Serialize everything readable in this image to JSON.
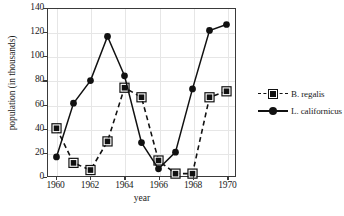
{
  "chart_data": {
    "type": "line",
    "title": "",
    "xlabel": "year",
    "ylabel": "population (in thousands)",
    "xlim": [
      1959.5,
      1970.5
    ],
    "ylim": [
      0,
      140
    ],
    "ytick_labels": [
      "0",
      "20",
      "40",
      "60",
      "80",
      "100",
      "120",
      "140"
    ],
    "ytick_values": [
      0,
      20,
      40,
      60,
      80,
      100,
      120,
      140
    ],
    "xtick_labels": [
      "1960",
      "1962",
      "1964",
      "1966",
      "1968",
      "1970"
    ],
    "xtick_values": [
      1960,
      1962,
      1964,
      1966,
      1968,
      1970
    ],
    "x": [
      1960,
      1961,
      1962,
      1963,
      1964,
      1965,
      1966,
      1967,
      1968,
      1969,
      1970
    ],
    "grid": true,
    "legend_position": "right",
    "series": [
      {
        "name": "B. regalis",
        "marker": "square",
        "linestyle": "dashed",
        "color": "#111111",
        "values": [
          40,
          11,
          5,
          29,
          74,
          66,
          13,
          2,
          2,
          66,
          71
        ]
      },
      {
        "name": "L. californicus",
        "marker": "circle",
        "linestyle": "solid",
        "color": "#111111",
        "values": [
          16,
          61,
          80,
          117,
          84,
          28,
          6,
          20,
          73,
          122,
          127
        ]
      }
    ]
  },
  "legend": {
    "items": [
      {
        "label": "B. regalis"
      },
      {
        "label": "L. californicus"
      }
    ]
  }
}
